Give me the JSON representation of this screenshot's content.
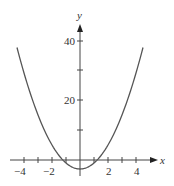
{
  "chart_data": {
    "type": "line",
    "title": "",
    "xlabel": "x",
    "ylabel": "y",
    "function": "y = 2x^2 - 3",
    "xlim": [
      -4.5,
      4.5
    ],
    "ylim": [
      -3,
      45
    ],
    "grid": false,
    "legend": null,
    "x_ticks": [
      -4,
      -3,
      -2,
      -1,
      1,
      2,
      3,
      4
    ],
    "x_tick_labels": [
      "-4",
      "-2",
      "2",
      "4"
    ],
    "y_ticks": [
      10,
      20,
      30,
      40
    ],
    "y_tick_labels": [
      "20",
      "40"
    ],
    "series": [
      {
        "name": "parabola",
        "color": "#555555",
        "x": [
          -4.5,
          -4,
          -3,
          -2,
          -1,
          0,
          1,
          2,
          3,
          4,
          4.5
        ],
        "y": [
          37.5,
          29,
          15,
          5,
          -1,
          -3,
          -1,
          5,
          15,
          29,
          37.5
        ]
      }
    ]
  },
  "labels": {
    "x_axis": "x",
    "y_axis": "y",
    "xt_m4": "−4",
    "xt_m2": "−2",
    "xt_2": "2",
    "xt_4": "4",
    "yt_20": "20",
    "yt_40": "40"
  }
}
